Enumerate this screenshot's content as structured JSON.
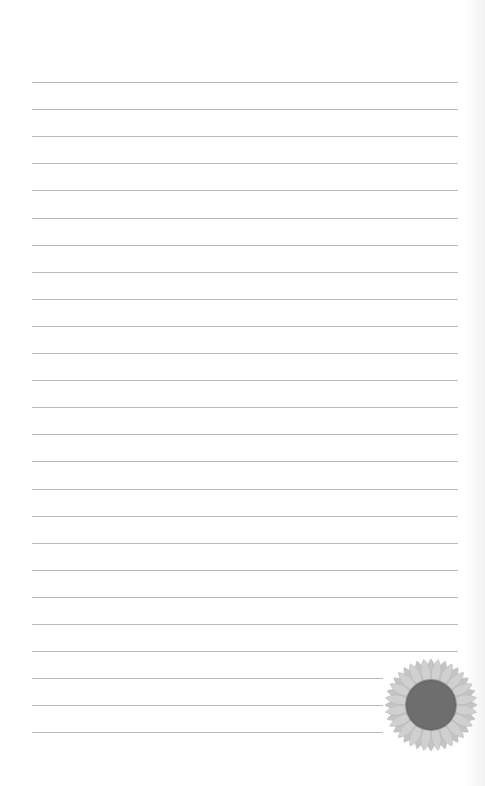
{
  "document": {
    "type": "lined-notepaper",
    "line_count": 25,
    "first_line_y": 82,
    "line_spacing": 27.1,
    "line_left": 32,
    "line_right_full": 458,
    "line_right_short": 383,
    "short_lines_count": 3,
    "line_color": "#b9b9b9"
  },
  "decoration": {
    "icon": "sunflower-icon",
    "petal_color": "#d0d0d0",
    "center_color": "#6e6e6e"
  }
}
